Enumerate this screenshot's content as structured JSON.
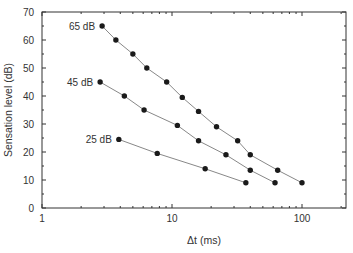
{
  "chart_data": {
    "type": "line",
    "title": "",
    "xlabel": "Δt (ms)",
    "ylabel": "Sensation level (dB)",
    "xscale": "log",
    "xlim": [
      1,
      160
    ],
    "ylim": [
      0,
      70
    ],
    "x_ticks": [
      "1",
      "10",
      "100"
    ],
    "y_ticks": [
      "0",
      "10",
      "20",
      "30",
      "40",
      "50",
      "60",
      "70"
    ],
    "grid": false,
    "legend": "inline labels",
    "series": [
      {
        "name": "65 dB",
        "x": [
          2.9,
          3.7,
          5.0,
          6.4,
          9.1,
          12,
          16,
          22,
          32,
          40,
          65,
          100
        ],
        "y": [
          65,
          60,
          55,
          50,
          45,
          39.5,
          34.5,
          29,
          24,
          19,
          13.5,
          9
        ]
      },
      {
        "name": "45 dB",
        "x": [
          2.8,
          4.3,
          6.1,
          11,
          16,
          26,
          40,
          62
        ],
        "y": [
          45,
          40,
          35,
          29.5,
          24,
          19,
          13.5,
          9
        ]
      },
      {
        "name": "25 dB",
        "x": [
          3.9,
          7.7,
          18,
          37
        ],
        "y": [
          24.5,
          19.5,
          14,
          9
        ]
      }
    ]
  }
}
